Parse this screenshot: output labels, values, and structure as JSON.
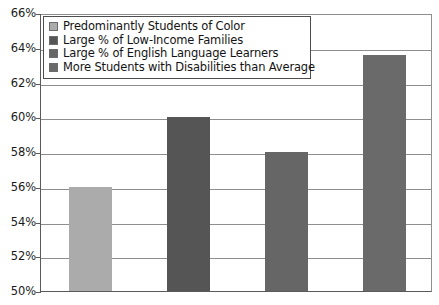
{
  "chart_data": {
    "type": "bar",
    "title": "",
    "subtitle": "",
    "xlabel": "",
    "ylabel": "",
    "categories": [
      "Predominantly Students of Color",
      "Large % of Low-Income Families",
      "Large % of English Language Learners",
      "More Students with Disabilities than Average"
    ],
    "values": [
      56,
      60,
      58,
      63.6
    ],
    "value_labels": [
      "56%",
      "60%",
      "58%",
      "63.6%"
    ],
    "ylim": [
      50,
      66
    ],
    "ytick_labels": [
      "66%",
      "64%",
      "62%",
      "60%",
      "58%",
      "56%",
      "54%",
      "52%",
      "50%"
    ],
    "ytick_values": [
      66,
      64,
      62,
      60,
      58,
      56,
      54,
      52,
      50
    ],
    "xtick_labels": [],
    "grid": "horizontal",
    "legend_position": "top-left",
    "bar_colors": [
      "#ababab",
      "#555555",
      "#666666",
      "#6a6a6a"
    ],
    "series": [
      {
        "name": "Percent",
        "values": [
          56,
          60,
          58,
          63.6
        ]
      }
    ]
  },
  "legend": {
    "items": [
      {
        "label": "Predominantly Students of Color",
        "color": "#ababab"
      },
      {
        "label": "Large % of Low-Income Families",
        "color": "#555555"
      },
      {
        "label": "Large % of English Language Learners",
        "color": "#666666"
      },
      {
        "label": "More Students with Disabilities than Average",
        "color": "#6a6a6a"
      }
    ]
  },
  "axis": {
    "y_min_label": "50%",
    "y_max_label": "66%"
  }
}
